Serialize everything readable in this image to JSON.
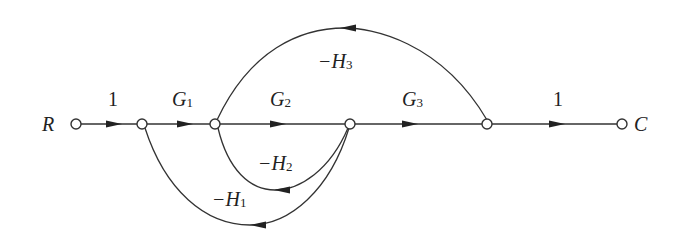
{
  "diagram": {
    "type": "signal-flow-graph",
    "nodes": [
      {
        "id": "R",
        "label": "R",
        "x": 76,
        "y": 124
      },
      {
        "id": "n1",
        "label": "",
        "x": 142,
        "y": 124
      },
      {
        "id": "n2",
        "label": "",
        "x": 215,
        "y": 124
      },
      {
        "id": "n3",
        "label": "",
        "x": 350,
        "y": 124
      },
      {
        "id": "n4",
        "label": "",
        "x": 487,
        "y": 124
      },
      {
        "id": "C",
        "label": "C",
        "x": 622,
        "y": 124
      }
    ],
    "edges": [
      {
        "from": "R",
        "to": "n1",
        "gain": "1"
      },
      {
        "from": "n1",
        "to": "n2",
        "gain": "G1",
        "main": "G",
        "sub": "1"
      },
      {
        "from": "n2",
        "to": "n3",
        "gain": "G2",
        "main": "G",
        "sub": "2"
      },
      {
        "from": "n3",
        "to": "n4",
        "gain": "G3",
        "main": "G",
        "sub": "3"
      },
      {
        "from": "n4",
        "to": "C",
        "gain": "1"
      },
      {
        "from": "n4",
        "to": "n2",
        "gain": "-H3",
        "main": "−H",
        "sub": "3"
      },
      {
        "from": "n3",
        "to": "n2",
        "gain": "-H2",
        "main": "−H",
        "sub": "2"
      },
      {
        "from": "n3",
        "to": "n1",
        "gain": "-H1",
        "main": "−H",
        "sub": "1"
      }
    ],
    "labels": {
      "R": "R",
      "C": "C",
      "e_R_n1": "1",
      "e_n4_C": "1",
      "G1_main": "G",
      "G1_sub": "1",
      "G2_main": "G",
      "G2_sub": "2",
      "G3_main": "G",
      "G3_sub": "3",
      "H3_main": "−H",
      "H3_sub": "3",
      "H2_main": "−H",
      "H2_sub": "2",
      "H1_main": "−H",
      "H1_sub": "1"
    }
  }
}
